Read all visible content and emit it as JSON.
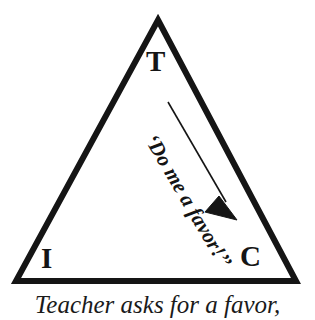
{
  "figure": {
    "type": "triangle-relationship-diagram",
    "caption": "Teacher asks for a favor,",
    "background_color": "#ffffff",
    "ink_color": "#151515"
  },
  "triangle": {
    "name": "TIC triangle",
    "stroke_color": "#151515",
    "stroke_width": 6,
    "apex_label": "T",
    "bottom_left_label": "I",
    "bottom_right_label": "C",
    "vertices": {
      "apex": {
        "x": 158,
        "y": 20
      },
      "bottom_left": {
        "x": 16,
        "y": 281
      },
      "bottom_right": {
        "x": 296,
        "y": 281
      }
    }
  },
  "arrow": {
    "name": "teacher-to-c-arrow",
    "from": "T",
    "to": "C",
    "direction": "down-right",
    "stroke_color": "#151515",
    "stroke_width": 1.6,
    "start": {
      "x": 168,
      "y": 102
    },
    "end": {
      "x": 236,
      "y": 219
    }
  },
  "labels": {
    "utterance": "‘Do me a favor!’’",
    "utterance_rotation_deg": 59.5
  }
}
